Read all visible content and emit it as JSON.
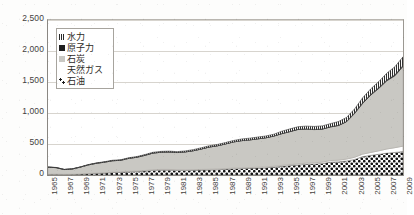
{
  "chart_data": {
    "type": "area",
    "stacked": true,
    "title": "",
    "subtitle": "",
    "xlabel": "",
    "ylabel": "",
    "xlim": [
      1965,
      2009
    ],
    "ylim": [
      0,
      2500
    ],
    "grid": true,
    "grid_axis": "y",
    "legend_position": "top-left-inside",
    "ytick_labels": [
      "2,500",
      "2,000",
      "1,500",
      "1,000",
      "500",
      "0"
    ],
    "ytick_values": [
      2500,
      2000,
      1500,
      1000,
      500,
      0
    ],
    "xtick_labels": [
      "1965",
      "1967",
      "1969",
      "1971",
      "1973",
      "1975",
      "1977",
      "1979",
      "1981",
      "1983",
      "1985",
      "1987",
      "1989",
      "1991",
      "1993",
      "1995",
      "1997",
      "1999",
      "2001",
      "2003",
      "2005",
      "2007",
      "2009"
    ],
    "x": [
      1965,
      1966,
      1967,
      1968,
      1969,
      1970,
      1971,
      1972,
      1973,
      1974,
      1975,
      1976,
      1977,
      1978,
      1979,
      1980,
      1981,
      1982,
      1983,
      1984,
      1985,
      1986,
      1987,
      1988,
      1989,
      1990,
      1991,
      1992,
      1993,
      1994,
      1995,
      1996,
      1997,
      1998,
      1999,
      2000,
      2001,
      2002,
      2003,
      2004,
      2005,
      2006,
      2007,
      2008,
      2009
    ],
    "series": [
      {
        "name": "石油",
        "key": "oil",
        "pattern": "checkerboard",
        "color": "#1c1c1c",
        "values": [
          11,
          13,
          10,
          11,
          15,
          21,
          27,
          31,
          40,
          44,
          52,
          56,
          63,
          74,
          78,
          78,
          74,
          73,
          75,
          79,
          82,
          86,
          92,
          100,
          103,
          107,
          112,
          116,
          128,
          140,
          153,
          161,
          174,
          177,
          187,
          209,
          212,
          227,
          252,
          297,
          318,
          334,
          353,
          364,
          381
        ]
      },
      {
        "name": "天然ガス",
        "key": "gas",
        "pattern": "blank",
        "color": "#ffffff",
        "values": [
          1,
          1,
          1,
          1,
          2,
          3,
          4,
          5,
          6,
          7,
          8,
          9,
          10,
          11,
          12,
          12,
          11,
          11,
          11,
          11,
          11,
          12,
          12,
          12,
          13,
          13,
          14,
          14,
          15,
          16,
          16,
          17,
          18,
          19,
          21,
          24,
          27,
          30,
          34,
          40,
          46,
          56,
          67,
          77,
          85
        ]
      },
      {
        "name": "石炭",
        "key": "coal",
        "pattern": "solid-gray",
        "color": "#c9c8c3",
        "values": [
          114,
          105,
          77,
          85,
          110,
          139,
          158,
          171,
          184,
          186,
          208,
          221,
          244,
          268,
          277,
          281,
          277,
          288,
          305,
          329,
          358,
          373,
          397,
          421,
          438,
          446,
          457,
          470,
          485,
          510,
          530,
          556,
          548,
          536,
          531,
          541,
          558,
          600,
          705,
          817,
          924,
          1007,
          1099,
          1159,
          1285
        ]
      },
      {
        "name": "原子力",
        "key": "nuclear",
        "pattern": "solid-dark",
        "color": "#2b2b2b",
        "values": [
          0,
          0,
          0,
          0,
          0,
          0,
          0,
          0,
          0,
          0,
          0,
          0,
          0,
          0,
          0,
          0,
          0,
          0,
          0,
          0,
          0,
          0,
          0,
          0,
          0,
          0,
          0,
          0.1,
          0.3,
          3,
          3,
          3,
          3,
          3,
          3,
          4,
          4,
          6,
          10,
          11,
          12,
          12,
          14,
          15,
          16
        ]
      },
      {
        "name": "水力",
        "key": "hydro",
        "pattern": "vertical-hatch",
        "color": "#555555",
        "values": [
          2,
          3,
          3,
          3,
          4,
          5,
          6,
          7,
          8,
          9,
          10,
          11,
          12,
          13,
          14,
          14,
          15,
          16,
          18,
          20,
          21,
          22,
          22,
          24,
          27,
          28,
          29,
          29,
          30,
          38,
          42,
          42,
          45,
          48,
          50,
          50,
          61,
          65,
          65,
          80,
          89,
          98,
          110,
          132,
          139
        ]
      }
    ],
    "totals": [
      128,
      122,
      91,
      100,
      131,
      168,
      195,
      214,
      238,
      246,
      278,
      297,
      329,
      366,
      381,
      385,
      377,
      388,
      409,
      439,
      472,
      493,
      523,
      557,
      581,
      594,
      612,
      629,
      658,
      707,
      744,
      779,
      788,
      783,
      792,
      828,
      862,
      928,
      1066,
      1245,
      1389,
      1507,
      1643,
      1747,
      1906
    ]
  },
  "legend": {
    "items": [
      {
        "label": "水力",
        "swatch_class": "sw-hydro",
        "name": "legend-item-hydro"
      },
      {
        "label": "原子力",
        "swatch_class": "sw-nuclear",
        "name": "legend-item-nuclear"
      },
      {
        "label": "石炭",
        "swatch_class": "sw-coal",
        "name": "legend-item-coal"
      },
      {
        "label": "天然ガス",
        "swatch_class": "sw-gas",
        "name": "legend-item-gas"
      },
      {
        "label": "石油",
        "swatch_class": "sw-oil",
        "name": "legend-item-oil"
      }
    ]
  },
  "colors": {
    "axis": "#8a8782",
    "gridline": "#d7d4ce",
    "plot_background": "#ffffff",
    "page_background": "#fdfdfc",
    "text": "#44413c",
    "coal_fill": "#c9c8c3",
    "oil_fill": "#1c1c1c",
    "gas_fill": "#ffffff",
    "nuclear_fill": "#2b2b2b",
    "hydro_fill": "#555555"
  }
}
